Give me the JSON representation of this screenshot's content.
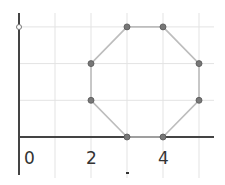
{
  "diagram": {
    "type": "coordinate-grid-polygon",
    "shape": "octagon",
    "x_tick_labels": [
      "0",
      "2",
      "4"
    ],
    "x_tick_values": [
      0,
      2,
      4
    ],
    "vertices": [
      {
        "x": 3,
        "y": 0
      },
      {
        "x": 4,
        "y": 0
      },
      {
        "x": 5,
        "y": 1
      },
      {
        "x": 5,
        "y": 2
      },
      {
        "x": 4,
        "y": 3
      },
      {
        "x": 3,
        "y": 3
      },
      {
        "x": 2,
        "y": 2
      },
      {
        "x": 2,
        "y": 1
      }
    ],
    "grid": {
      "x_range": [
        0,
        5.4
      ],
      "y_range": [
        -1,
        3.3
      ]
    },
    "colors": {
      "axis": "#444444",
      "grid": "#e3e3e3",
      "polygon_edge": "#bdbdbd",
      "vertex_fill": "#777777",
      "vertex_stroke": "#555555"
    }
  }
}
